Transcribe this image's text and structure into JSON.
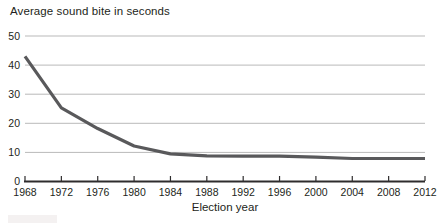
{
  "chart_data": {
    "type": "line",
    "title": "Average sound bite in seconds",
    "xlabel": "Election year",
    "ylabel": "",
    "x": [
      1968,
      1972,
      1976,
      1980,
      1984,
      1988,
      1992,
      1996,
      2000,
      2004,
      2008,
      2012
    ],
    "values": [
      43,
      25.3,
      18.2,
      12.2,
      9.5,
      8.8,
      8.7,
      8.7,
      8.4,
      7.9,
      7.9,
      7.9
    ],
    "ylim": [
      0,
      50
    ],
    "yticks": [
      0,
      10,
      20,
      30,
      40,
      50
    ],
    "xticks": [
      1968,
      1972,
      1976,
      1980,
      1984,
      1988,
      1992,
      1996,
      2000,
      2004,
      2008,
      2012
    ],
    "grid": true,
    "legend": "none",
    "colors": {
      "line": "#59595b",
      "grid": "#b9b9b9",
      "axis": "#2e2c2d",
      "text": "#231f20",
      "background": "#ffffff"
    }
  }
}
